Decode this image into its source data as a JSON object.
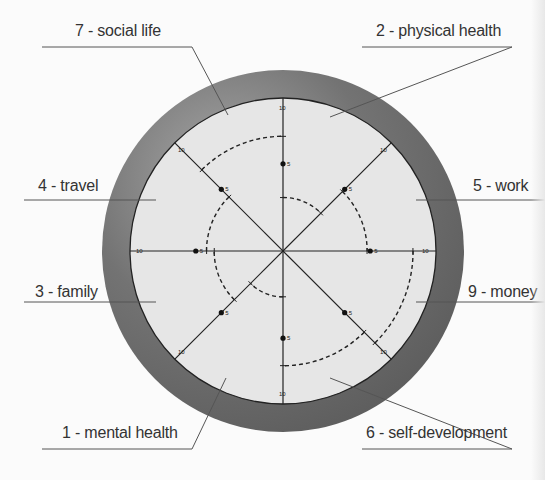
{
  "center": {
    "x": 283,
    "y": 251
  },
  "radii": {
    "outer": 181,
    "inner": 153,
    "max_score": 10
  },
  "colors": {
    "ring": "#7a7a7a",
    "ring_dark": "#5e5e5e",
    "inner_fill": "#e6e6e6",
    "line": "#222222",
    "background": "#fbfbfb",
    "label_text": "#333333",
    "leader": "#555555"
  },
  "tick_labels": {
    "half": "5",
    "full": "10"
  },
  "sectors": [
    {
      "id": "physical-health",
      "label": "2 - physical health",
      "start_deg": -90,
      "end_deg": -45,
      "score": 3.5
    },
    {
      "id": "work",
      "label": "5 - work",
      "start_deg": -45,
      "end_deg": 0,
      "score": 5.5
    },
    {
      "id": "money",
      "label": "9 - money",
      "start_deg": 0,
      "end_deg": 45,
      "score": 8.5
    },
    {
      "id": "self-development",
      "label": "6 - self-development",
      "start_deg": 45,
      "end_deg": 90,
      "score": 7.5
    },
    {
      "id": "mental-health",
      "label": "1 - mental health",
      "start_deg": 90,
      "end_deg": 135,
      "score": 3
    },
    {
      "id": "family",
      "label": "3 - family",
      "start_deg": 135,
      "end_deg": 180,
      "score": 4.5
    },
    {
      "id": "travel",
      "label": "4 - travel",
      "start_deg": 180,
      "end_deg": 225,
      "score": 5
    },
    {
      "id": "social-life",
      "label": "7 - social life",
      "start_deg": 225,
      "end_deg": 270,
      "score": 7.5
    }
  ],
  "labels": [
    {
      "text": "7 - social life",
      "x": 75,
      "y": 22,
      "line": [
        [
          42,
          47
        ],
        [
          192,
          47
        ],
        [
          228,
          115
        ]
      ]
    },
    {
      "text": "2 - physical health",
      "x": 376,
      "y": 22,
      "line": [
        [
          362,
          47
        ],
        [
          512,
          47
        ],
        [
          330,
          117
        ]
      ]
    },
    {
      "text": "4 - travel",
      "x": 38,
      "y": 177,
      "line": [
        [
          24,
          200
        ],
        [
          156,
          200
        ]
      ]
    },
    {
      "text": "5 - work",
      "x": 473,
      "y": 177,
      "line": [
        [
          416,
          200
        ],
        [
          545,
          200
        ]
      ]
    },
    {
      "text": "3 - family",
      "x": 35,
      "y": 283,
      "line": [
        [
          24,
          302
        ],
        [
          156,
          302
        ]
      ]
    },
    {
      "text": "9 - money",
      "x": 468,
      "y": 283,
      "line": [
        [
          416,
          302
        ],
        [
          545,
          302
        ]
      ]
    },
    {
      "text": "1 - mental health",
      "x": 62,
      "y": 424,
      "line": [
        [
          42,
          449
        ],
        [
          192,
          449
        ],
        [
          226,
          378
        ]
      ]
    },
    {
      "text": "6 - self-development",
      "x": 366,
      "y": 424,
      "line": [
        [
          362,
          449
        ],
        [
          512,
          449
        ],
        [
          330,
          378
        ]
      ]
    }
  ]
}
